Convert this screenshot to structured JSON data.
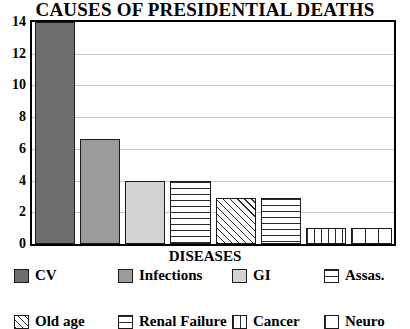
{
  "chart_data": {
    "type": "bar",
    "title": "CAUSES OF PRESIDENTIAL DEATHS",
    "xlabel": "DISEASES",
    "ylabel": "",
    "ylim": [
      0,
      14
    ],
    "yticks": [
      0,
      2,
      4,
      6,
      8,
      10,
      12,
      14
    ],
    "grid": true,
    "legend_position": "bottom",
    "categories": [
      "CV",
      "Infections",
      "GI",
      "Assas.",
      "Old age",
      "Renal Failure",
      "Cancer",
      "Neuro"
    ],
    "values": [
      14,
      6.6,
      4,
      4,
      2.9,
      2.9,
      1,
      1
    ],
    "series": [
      {
        "name": "Deaths",
        "values": [
          14,
          6.6,
          4,
          4,
          2.9,
          2.9,
          1,
          1
        ]
      }
    ],
    "points": [
      {
        "category": "CV",
        "value": 14,
        "fill": "solid-dark"
      },
      {
        "category": "Infections",
        "value": 6.6,
        "fill": "solid-mid"
      },
      {
        "category": "GI",
        "value": 4,
        "fill": "solid-light"
      },
      {
        "category": "Assas.",
        "value": 4,
        "fill": "horizontal-lines"
      },
      {
        "category": "Old age",
        "value": 2.9,
        "fill": "diagonal-hatch"
      },
      {
        "category": "Renal Failure",
        "value": 2.9,
        "fill": "crosshatch-grid"
      },
      {
        "category": "Cancer",
        "value": 1,
        "fill": "vertical-lines"
      },
      {
        "category": "Neuro",
        "value": 1,
        "fill": "vertical-lines-wide"
      }
    ]
  },
  "axis": {
    "y_tick_labels": [
      "14",
      "12",
      "10",
      "8",
      "6",
      "4",
      "2",
      "0"
    ],
    "x_title": "DISEASES"
  },
  "legend": {
    "rows": [
      [
        {
          "label": "CV",
          "fill": "solid-dark"
        },
        {
          "label": "Infections",
          "fill": "solid-mid"
        },
        {
          "label": "GI",
          "fill": "solid-light"
        },
        {
          "label": "Assas.",
          "fill": "horizontal-lines"
        }
      ],
      [
        {
          "label": "Old age",
          "fill": "diagonal-hatch"
        },
        {
          "label": "Renal Failure",
          "fill": "crosshatch-grid"
        },
        {
          "label": "Cancer",
          "fill": "vertical-lines"
        },
        {
          "label": "Neuro",
          "fill": "vertical-lines-wide"
        }
      ]
    ]
  },
  "colors": {
    "solid_dark": "#6e6e6e",
    "solid_mid": "#9b9b9b",
    "solid_light": "#d4d4d4",
    "axis": "#000000",
    "gridline": "#c8c8c8",
    "background": "#ffffff"
  }
}
